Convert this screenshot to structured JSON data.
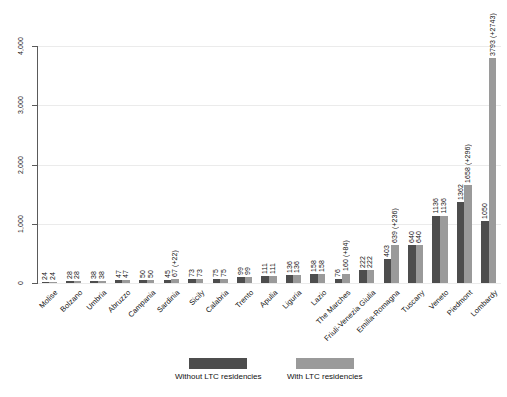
{
  "chart_data": {
    "type": "bar",
    "title": "",
    "subtitle": "",
    "xlabel": "",
    "ylabel": "",
    "ylim": [
      0,
      4000
    ],
    "yticks": [
      0,
      1000,
      2000,
      3000,
      4000
    ],
    "ytick_labels": [
      "0",
      "1,000",
      "2,000",
      "3,000",
      "4,000"
    ],
    "grid": true,
    "legend_position": "bottom",
    "categories": [
      "Molise",
      "Bolzano",
      "Umbria",
      "Abruzzo",
      "Campania",
      "Sardinia",
      "Sicily",
      "Calabria",
      "Trento",
      "Apulia",
      "Liguria",
      "Lazio",
      "The Marches",
      "Friuli-Venezia Giulia",
      "Emilia-Romagna",
      "Tuscany",
      "Veneto",
      "Piedmont",
      "Lombardy"
    ],
    "series": [
      {
        "name": "Without LTC residencies",
        "color": "#4d4d4d",
        "values": [
          24,
          28,
          38,
          47,
          50,
          45,
          73,
          75,
          99,
          111,
          136,
          158,
          76,
          222,
          403,
          640,
          1136,
          1362,
          1050
        ]
      },
      {
        "name": "With LTC residencies",
        "color": "#9a9a9a",
        "values": [
          24,
          28,
          38,
          47,
          50,
          67,
          73,
          75,
          99,
          111,
          136,
          158,
          160,
          222,
          639,
          640,
          1136,
          1658,
          3793
        ]
      }
    ],
    "bar_labels": {
      "without": [
        "24",
        "28",
        "38",
        "47",
        "50",
        "45",
        "73",
        "75",
        "99",
        "111",
        "136",
        "158",
        "76",
        "222",
        "403",
        "640",
        "1136",
        "1362",
        "1050"
      ],
      "with": [
        "24",
        "28",
        "38",
        "47",
        "50",
        "67 (+22)",
        "73",
        "75",
        "99",
        "111",
        "136",
        "158",
        "160 (+84)",
        "222",
        "639 (+236)",
        "640",
        "1136",
        "1658 (+296)",
        "3793 (+2743)"
      ]
    }
  },
  "legend": {
    "entries": [
      {
        "label": "Without LTC residencies",
        "color": "#4d4d4d"
      },
      {
        "label": "With LTC residencies",
        "color": "#9a9a9a"
      }
    ]
  }
}
